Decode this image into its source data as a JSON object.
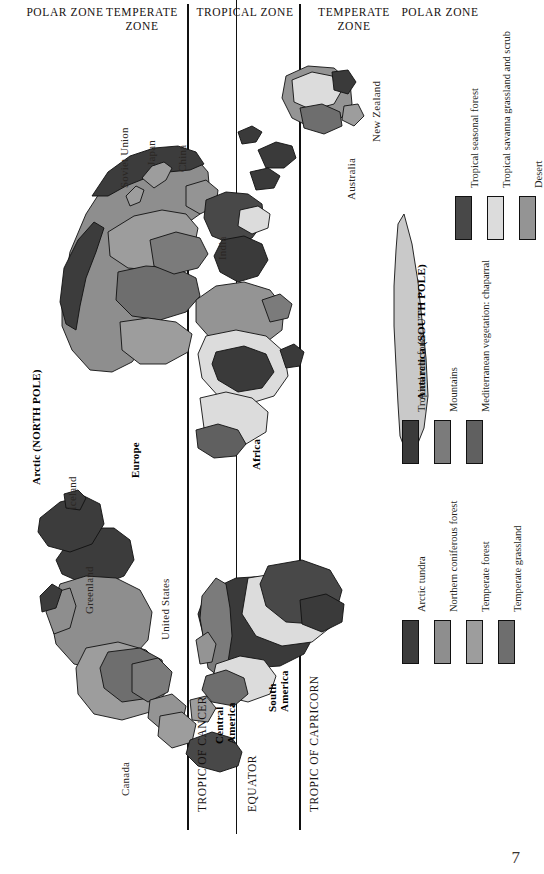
{
  "page": {
    "number": "7"
  },
  "orientation": "map rotated 90 degrees; text reads bottom-to-top",
  "zones": {
    "items": [
      {
        "label": "POLAR\nZONE",
        "name": "polar-zone-left"
      },
      {
        "label": "TEMPERATE\nZONE",
        "name": "temperate-zone-left"
      },
      {
        "label": "TROPICAL ZONE",
        "name": "tropical-zone"
      },
      {
        "label": "TEMPERATE\nZONE",
        "name": "temperate-zone-right"
      },
      {
        "label": "POLAR\nZONE",
        "name": "polar-zone-right"
      }
    ],
    "polar_left": "POLAR ZONE",
    "temperate_left": "TEMPERATE ZONE",
    "tropical": "TROPICAL ZONE",
    "temperate_right": "TEMPERATE ZONE",
    "polar_right": "POLAR ZONE"
  },
  "latitude_lines": {
    "tropic_of_cancer": "TROPIC OF CANCER",
    "equator": "EQUATOR",
    "tropic_of_capricorn": "TROPIC OF CAPRICORN"
  },
  "poles": {
    "arctic": "Arctic (NORTH POLE)",
    "antarctica": "Antarctica (SOUTH POLE)"
  },
  "places": {
    "soviet_union": "Soviet Union",
    "japan": "Japan",
    "china": "China",
    "india": "India",
    "australia": "Australia",
    "new_zealand": "New Zealand",
    "iceland": "Iceland",
    "greenland": "Greenland",
    "canada": "Canada",
    "united_states": "United States",
    "europe": "Europe",
    "africa": "Africa",
    "central_america": "Central America",
    "south_america": "South America"
  },
  "legend": {
    "columns": [
      {
        "name": "legend-column-1",
        "items": [
          {
            "label": "Arctic tundra",
            "color": "#3c3c3c"
          },
          {
            "label": "Northern coniferous forest",
            "color": "#8e8e8e"
          },
          {
            "label": "Temperate forest",
            "color": "#9d9d9d"
          },
          {
            "label": "Temperate grassland",
            "color": "#6e6e6e"
          }
        ]
      },
      {
        "name": "legend-column-2",
        "items": [
          {
            "label": "Tropical rain forest",
            "color": "#3a3a3a"
          },
          {
            "label": "Mountains",
            "color": "#7b7b7b"
          },
          {
            "label": "Mediterranean vegetation: chaparral",
            "color": "#606060"
          }
        ]
      },
      {
        "name": "legend-column-3",
        "items": [
          {
            "label": "Tropical seasonal forest",
            "color": "#484848"
          },
          {
            "label": "Tropical savanna grassland and scrub",
            "color": "#dcdcdc"
          },
          {
            "label": "Desert",
            "color": "#949494"
          }
        ]
      }
    ]
  },
  "colors": {
    "tundra": "#3c3c3c",
    "coniferous": "#8e8e8e",
    "temperate_forest": "#9d9d9d",
    "temperate_grassland": "#6e6e6e",
    "rain_forest": "#3a3a3a",
    "mountains": "#7b7b7b",
    "chaparral": "#606060",
    "seasonal_forest": "#484848",
    "savanna": "#dcdcdc",
    "desert": "#949494",
    "antarctica": "#c9c9c9",
    "outline": "#111111",
    "page_bg": "#ffffff"
  }
}
